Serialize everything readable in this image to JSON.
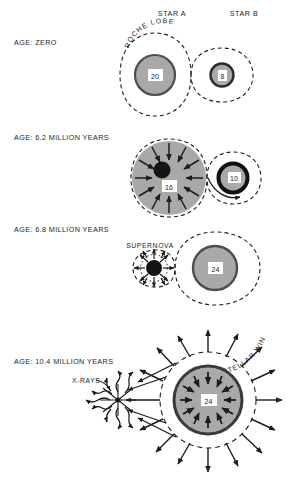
{
  "figure": {
    "background_color": "#ffffff",
    "ink_color": "#1c1c1c",
    "star_fill_color": "#aaaaaa",
    "star_rim_color": "#555555",
    "compact_object_color": "#111111",
    "width": 292,
    "height": 494
  },
  "header": {
    "star_a_label": "STAR A",
    "star_b_label": "STAR B"
  },
  "panels": [
    {
      "id": "panel-age-zero",
      "age_label": "AGE: ZERO",
      "annotations": [
        "ROCHE LOBE"
      ],
      "roche_lobe_label": "ROCHE LOBE",
      "stars": [
        {
          "name": "star-a",
          "mass_label": "20",
          "role": "primary",
          "fills_lobe": false
        },
        {
          "name": "star-b",
          "mass_label": "8",
          "role": "secondary",
          "fills_lobe": false
        }
      ]
    },
    {
      "id": "panel-age-6-2",
      "age_label": "AGE: 6.2 MILLION YEARS",
      "annotations": [],
      "stars": [
        {
          "name": "star-a",
          "mass_label": "16",
          "role": "mass-losing-primary",
          "fills_lobe": true
        },
        {
          "name": "star-b",
          "mass_label": "10",
          "role": "mass-gaining-secondary",
          "fills_lobe": false
        }
      ]
    },
    {
      "id": "panel-age-6-8",
      "age_label": "AGE: 6.8 MILLION YEARS",
      "annotations": [
        "SUPERNOVA"
      ],
      "supernova_label": "SUPERNOVA",
      "stars": [
        {
          "name": "star-a",
          "mass_label": "",
          "role": "supernova",
          "fills_lobe": false
        },
        {
          "name": "star-b",
          "mass_label": "24",
          "role": "secondary",
          "fills_lobe": false
        }
      ]
    },
    {
      "id": "panel-age-10-4",
      "age_label": "AGE: 10.4 MILLION YEARS",
      "annotations": [
        "X-RAYS",
        "STELLAR WIND"
      ],
      "xray_label": "X-RAYS",
      "stellar_wind_label": "STELLAR WIND",
      "stars": [
        {
          "name": "compact-object",
          "mass_label": "",
          "role": "neutron-star",
          "fills_lobe": false
        },
        {
          "name": "star-b",
          "mass_label": "24",
          "role": "wind-emitting-supergiant",
          "fills_lobe": false
        }
      ]
    }
  ]
}
